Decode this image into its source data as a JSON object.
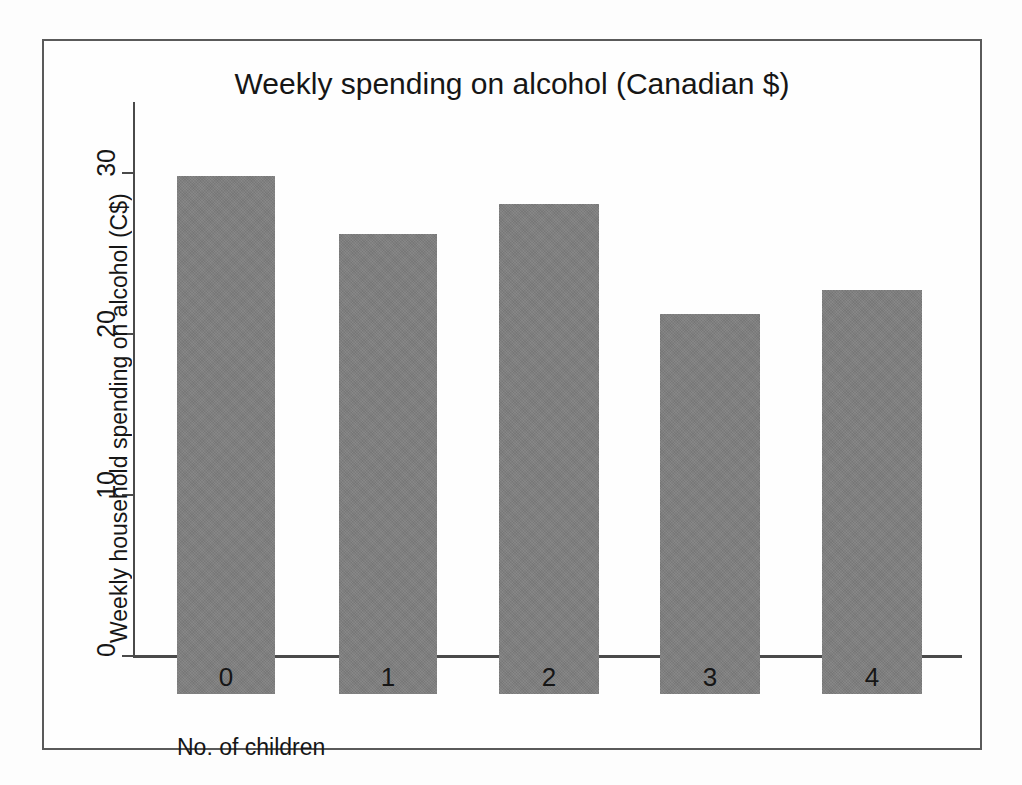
{
  "chart_data": {
    "type": "bar",
    "title": "Weekly spending on alcohol (Canadian $)",
    "xlabel": "No. of children",
    "ylabel": "Weekly household spending on alcohol (C$)",
    "categories": [
      "0",
      "1",
      "2",
      "3",
      "4"
    ],
    "values": [
      32.3,
      28.7,
      30.6,
      23.7,
      25.2
    ],
    "series": [
      {
        "name": "Weekly household spending on alcohol (C$)",
        "values": [
          32.3,
          28.7,
          30.6,
          23.7,
          25.2
        ]
      }
    ],
    "ylim": [
      0,
      34.5
    ],
    "yticks": [
      0,
      10,
      20,
      30
    ],
    "ytick_labels": [
      "0",
      "10",
      "20",
      "30"
    ],
    "xtick_labels": [
      "0",
      "1",
      "2",
      "3",
      "4"
    ],
    "grid": false,
    "legend": "none",
    "bar_color": "#7f7f7f",
    "axis_color": "#4a4a4a",
    "frame_color": "#5a5a5a",
    "background_color": "#fefefe"
  }
}
